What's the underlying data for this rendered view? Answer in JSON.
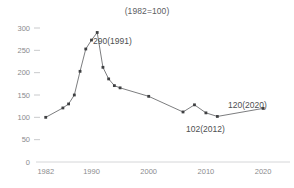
{
  "chart": {
    "title": "(1982=100)",
    "annotations": [
      {
        "id": "peak",
        "text": "290(1991)"
      },
      {
        "id": "low",
        "text": "102(2012)"
      },
      {
        "id": "last",
        "text": "120(2020)"
      }
    ]
  },
  "chart_data": {
    "type": "line",
    "title": "(1982=100)",
    "xlabel": "",
    "ylabel": "",
    "xlim": [
      1981,
      2024
    ],
    "ylim": [
      0,
      300
    ],
    "yticks": [
      0,
      50,
      100,
      150,
      200,
      250,
      300
    ],
    "ytick_labels": [
      "0",
      "50",
      "100",
      "150",
      "200",
      "250",
      "300"
    ],
    "xticks": [
      1982,
      1990,
      2000,
      2010,
      2020
    ],
    "xtick_labels": [
      "1982",
      "1990",
      "2000",
      "2010",
      "2020"
    ],
    "grid": false,
    "legend": "none",
    "marker": "square",
    "line_color": "#6d6e70",
    "marker_color": "#3f4042",
    "axis_color": "#d5d6d8",
    "tick_label_color": "#8a8b8d",
    "series": [
      {
        "name": "index",
        "x": [
          1982,
          1985,
          1986,
          1987,
          1988,
          1989,
          1990,
          1991,
          1992,
          1993,
          1994,
          1995,
          2000,
          2006,
          2008,
          2010,
          2012,
          2020
        ],
        "values": [
          100,
          121,
          130,
          150,
          203,
          253,
          273,
          290,
          212,
          186,
          171,
          166,
          147,
          112,
          128,
          110,
          102,
          120
        ]
      }
    ],
    "point_annotations": [
      {
        "x": 1991,
        "y": 290,
        "text": "290(1991)"
      },
      {
        "x": 2012,
        "y": 102,
        "text": "102(2012)"
      },
      {
        "x": 2020,
        "y": 120,
        "text": "120(2020)"
      }
    ]
  }
}
